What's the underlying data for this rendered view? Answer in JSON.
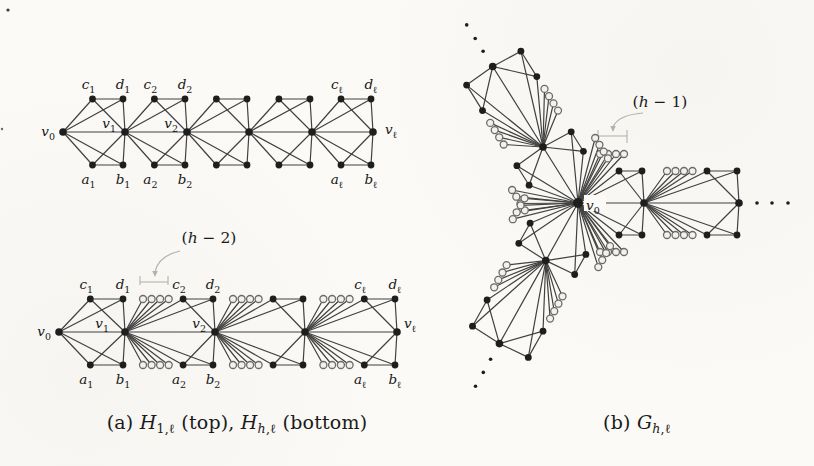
{
  "colors": {
    "background": "#fbfaf6",
    "edge": "#414141",
    "vertex": "#1e1e1e",
    "gray_vertex_fill": "#f2f1ec",
    "gray_vertex_stroke": "#6b6b6b",
    "annotation": "#b4b2ac",
    "label": "#161616"
  },
  "style": {
    "edge_w": 1.2,
    "vertex_r": 3.4,
    "spine_r": 3.8,
    "center_r": 5,
    "circle_r": 3.5,
    "tail_dot_r": 1.8
  },
  "figure_a": {
    "caption": {
      "pos": {
        "x": 237,
        "y": 411
      },
      "parts": [
        {
          "t": "(a) "
        },
        {
          "t": "H",
          "v": 1
        },
        {
          "t": "1,ℓ",
          "s": 1
        },
        {
          "t": " (top), "
        },
        {
          "t": "H",
          "v": 1
        },
        {
          "t": "h",
          "s": 1,
          "v": 1
        },
        {
          "t": ",ℓ",
          "s": 1
        },
        {
          "t": " (bottom)"
        }
      ]
    },
    "annotation": {
      "pos": {
        "x": 209,
        "y": 229
      },
      "parts": [
        {
          "t": "("
        },
        {
          "t": "h",
          "v": 1
        },
        {
          "t": " − 2)"
        }
      ],
      "graphics": {
        "bracket": {
          "x1": 140,
          "x2": 168,
          "y": 282,
          "tick_up": 6,
          "tick_down": 3
        },
        "arrow": {
          "d": "M 180 251 Q 158 256 155 272",
          "tip": [
            155,
            277
          ]
        }
      }
    },
    "corner_names": [
      "c",
      "d",
      "a",
      "b"
    ],
    "params": {
      "c_frac_plain": 0.475,
      "c_frac_circ": 0.645,
      "circ_start_frac": 0.2,
      "circ_step_frac": 0.095,
      "rise": 33
    },
    "top": {
      "spine_y": 132,
      "spine_xs": [
        63,
        125,
        187,
        249,
        312,
        373
      ],
      "gadget_circles": [
        false,
        false,
        false,
        false,
        false
      ],
      "gadget_label_subs": {
        "0": "1",
        "1": "2",
        "4": "ℓ"
      },
      "spine_labels": [
        {
          "i": 0,
          "main": "v",
          "sub": "0",
          "side": "left"
        },
        {
          "i": 1,
          "main": "v",
          "sub": "1",
          "side": "above-left"
        },
        {
          "i": 2,
          "main": "v",
          "sub": "2",
          "side": "above-left"
        },
        {
          "i": 5,
          "main": "v",
          "sub": "ℓ",
          "side": "right"
        }
      ]
    },
    "bottom": {
      "spine_y": 332,
      "spine_xs": [
        59,
        125,
        215,
        305,
        397
      ],
      "gadget_circles": [
        false,
        true,
        true,
        true
      ],
      "gadget_label_subs": {
        "0": "1",
        "1": "2",
        "3": "ℓ"
      },
      "spine_labels": [
        {
          "i": 0,
          "main": "v",
          "sub": "0",
          "side": "left"
        },
        {
          "i": 1,
          "main": "v",
          "sub": "1",
          "side": "above-left",
          "dx": -7
        },
        {
          "i": 2,
          "main": "v",
          "sub": "2",
          "side": "above-left"
        },
        {
          "i": 4,
          "main": "v",
          "sub": "ℓ",
          "side": "above-right"
        }
      ]
    }
  },
  "figure_b": {
    "caption": {
      "pos": {
        "x": 637,
        "y": 411
      },
      "parts": [
        {
          "t": "(b) "
        },
        {
          "t": "G",
          "v": 1
        },
        {
          "t": "h",
          "s": 1,
          "v": 1
        },
        {
          "t": ",ℓ",
          "s": 1
        }
      ]
    },
    "annotation": {
      "pos": {
        "x": 660,
        "y": 93
      },
      "parts": [
        {
          "t": "("
        },
        {
          "t": "h",
          "v": 1
        },
        {
          "t": " − 1)"
        }
      ],
      "graphics": {
        "bracket": {
          "x1": 598,
          "x2": 627,
          "y": 136,
          "tick_up": 6,
          "tick_down": 7
        },
        "arrow": {
          "d": "M 643 113 Q 618 115 613 127",
          "tip": [
            613,
            132
          ]
        }
      }
    },
    "center": {
      "x": 578,
      "y": 203
    },
    "center_label": {
      "main": "v",
      "sub": "0"
    },
    "g1": {
      "len": 66,
      "c_t": 41,
      "rise": 32,
      "circ_start": 22,
      "circ_step": 8,
      "circ_rise": 49
    },
    "g2": {
      "len": 95,
      "c_t": 63,
      "rise": 32,
      "circ_start": 23,
      "circ_step": 8.5,
      "circ_rise": 32
    },
    "arms": [
      {
        "tx": 1,
        "ty": 0,
        "nx": 0,
        "ny": -1
      },
      {
        "tx": -0.53,
        "ty": -0.848,
        "nx": 0.848,
        "ny": -0.53
      },
      {
        "tx": -0.488,
        "ty": 0.873,
        "nx": -0.873,
        "ny": -0.488
      }
    ],
    "tail_dot_offsets": [
      18,
      33,
      49
    ]
  }
}
